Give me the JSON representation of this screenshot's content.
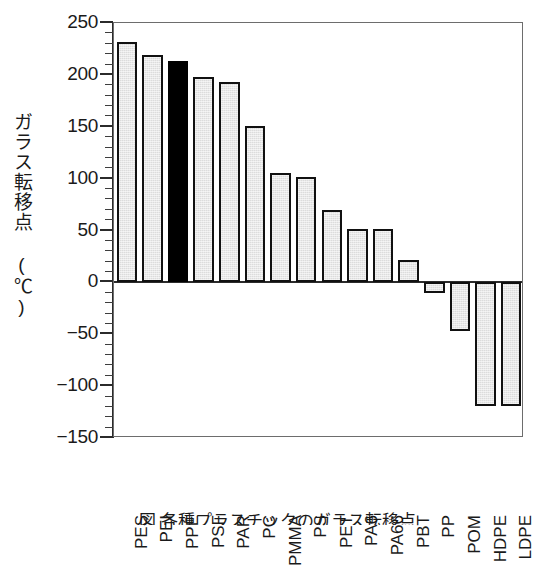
{
  "chart_data": {
    "type": "bar",
    "title": "",
    "xlabel": "",
    "ylabel": "ガラス転移点 (℃)",
    "ylim": [
      -150,
      250
    ],
    "ytick_step": 50,
    "yminor_step": 10,
    "grid": false,
    "legend": null,
    "highlight_category": "PPE",
    "highlight_color": "#000000",
    "bar_color": "#dcdcdc",
    "bar_edge_color": "#111111",
    "categories": [
      "PES",
      "PEI",
      "PPE",
      "PSF",
      "PAR",
      "PC",
      "PMMA",
      "PS",
      "PET",
      "PA6",
      "PA66",
      "PBT",
      "PP",
      "POM",
      "HDPE",
      "LDPE"
    ],
    "values": [
      232,
      219,
      213,
      198,
      193,
      151,
      105,
      102,
      70,
      51,
      51,
      22,
      -10,
      -47,
      -119,
      -119
    ],
    "ytick_labels": [
      "250",
      "200",
      "150",
      "100",
      "50",
      "0",
      "-50",
      "-100",
      "-150"
    ],
    "ytick_values": [
      250,
      200,
      150,
      100,
      50,
      0,
      -50,
      -100,
      -150
    ]
  },
  "caption": {
    "text": "図 各種プラスチックのガラス転移点"
  }
}
